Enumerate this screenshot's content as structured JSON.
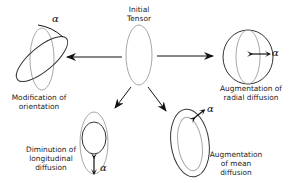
{
  "diagram": {
    "center": {
      "label_line1": "Initial",
      "label_line2": "Tensor"
    },
    "nodes": [
      {
        "id": "orientation",
        "label_line1": "Modification of",
        "label_line2": "orientation",
        "param": "α"
      },
      {
        "id": "radial",
        "label_line1": "Augmentation of",
        "label_line2": "radial diffusion",
        "param": "α"
      },
      {
        "id": "longitudinal",
        "label_line1": "Diminution of",
        "label_line2": "longitudinal",
        "label_line3": "diffusion",
        "param": "α"
      },
      {
        "id": "mean",
        "label_line1": "Augmentation",
        "label_line2": "of mean",
        "label_line3": "diffusion",
        "param": "α"
      }
    ],
    "colors": {
      "initial_stroke": "#a8a8a8",
      "modified_stroke": "#333333",
      "arrow": "#111111"
    }
  }
}
